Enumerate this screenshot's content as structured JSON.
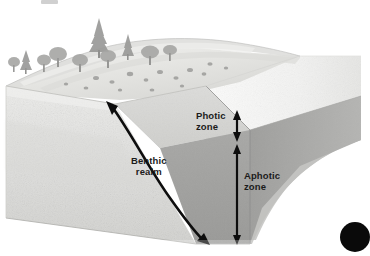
{
  "figure": {
    "labels": [
      {
        "id": "photic",
        "line1": "Photic",
        "line2": "zone",
        "text": "Photic zone"
      },
      {
        "id": "aphotic",
        "line1": "Aphotic",
        "line2": "zone",
        "text": "Aphotic zone"
      },
      {
        "id": "benthic",
        "line1": "Benthic",
        "line2": "realm",
        "text": "Benthic realm"
      }
    ],
    "annotations": {
      "photic_arrow": "double-headed vertical arrow marking photic zone depth",
      "aphotic_arrow": "double-headed vertical arrow marking aphotic zone depth",
      "benthic_arrow": "curved double-headed arrow following the sea floor"
    },
    "scene": {
      "land": "forested hillside with conifers, deciduous trees, shrubs and rocks",
      "water": "sea filling the cutaway block",
      "block": "three-dimensional cutaway earth block"
    },
    "colors": {
      "background": "#ffffff",
      "text": "#1b1b1b",
      "arrow": "#0d0d0d",
      "land_light": "#e9e9e7",
      "land_mid": "#cfcfcb",
      "water_surface": "#f4f4f3",
      "photic_water": "#d6d6d4",
      "aphotic_water": "#9f9f9d",
      "block_front": "#c9c9c6",
      "block_left": "#dededb"
    }
  }
}
